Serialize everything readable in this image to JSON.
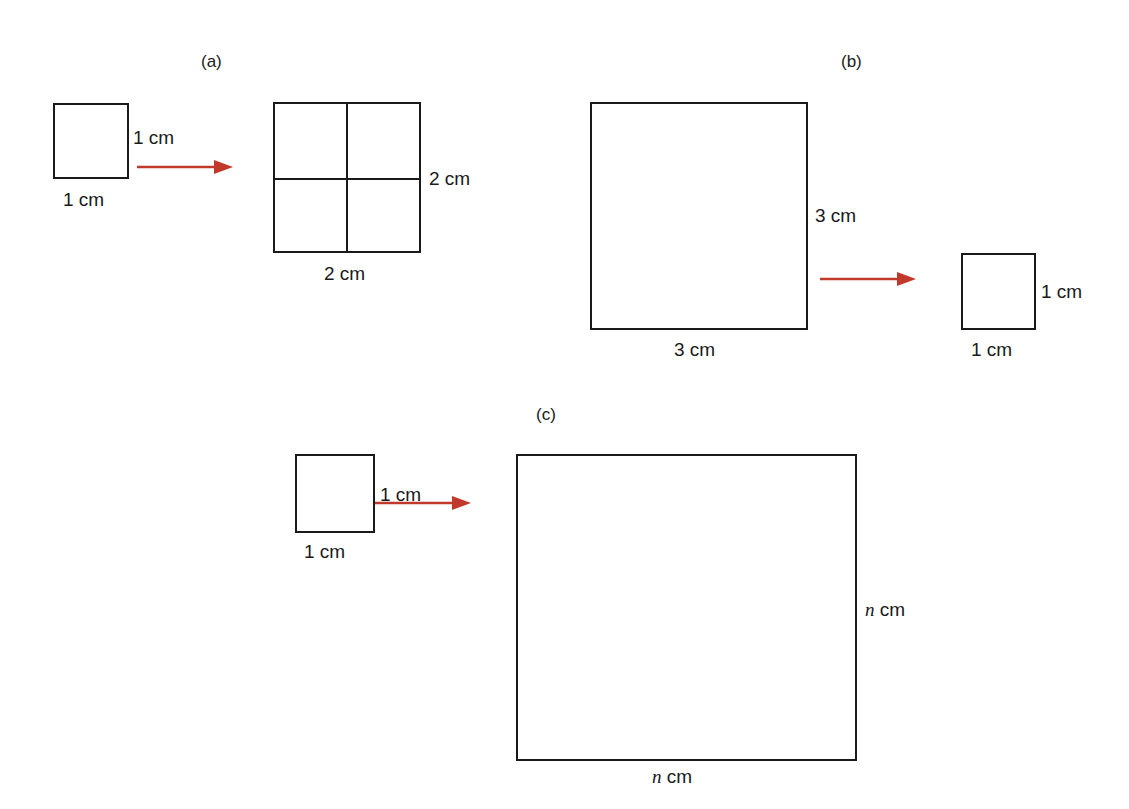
{
  "figure": {
    "arrow_color": "#c0392b",
    "stroke_color": "#1a1a1a"
  },
  "panels": {
    "a": {
      "label": "(a)",
      "source_square": {
        "side_label": "1 cm",
        "bottom_label": "1 cm"
      },
      "target_square": {
        "side_label": "2 cm",
        "bottom_label": "2 cm",
        "subdivisions": 4
      }
    },
    "b": {
      "label": "(b)",
      "source_square": {
        "side_label": "3 cm",
        "bottom_label": "3 cm"
      },
      "target_square": {
        "side_label": "1 cm",
        "bottom_label": "1 cm"
      }
    },
    "c": {
      "label": "(c)",
      "source_square": {
        "side_label": "1 cm",
        "bottom_label": "1 cm"
      },
      "target_square": {
        "side_var": "n",
        "side_unit": " cm",
        "bottom_var": "n",
        "bottom_unit": " cm"
      }
    }
  }
}
